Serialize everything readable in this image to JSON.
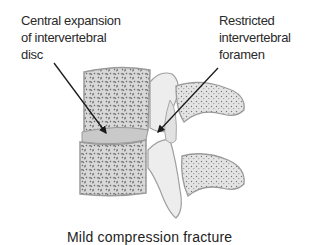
{
  "annotations": {
    "left": {
      "lines": [
        "Central expansion",
        "of intervertebral",
        "disc"
      ]
    },
    "right": {
      "lines": [
        "Restricted",
        "intervertebral",
        "foramen"
      ]
    }
  },
  "caption": "Mild compression fracture",
  "colors": {
    "bone_fill": "#dcdcdc",
    "bone_outline": "#9a9a9a",
    "trabecular": "#6e6e6e",
    "disc_fill": "#c8c8c8",
    "arrow": "#1a1a1a",
    "text": "#2a2a2a"
  }
}
